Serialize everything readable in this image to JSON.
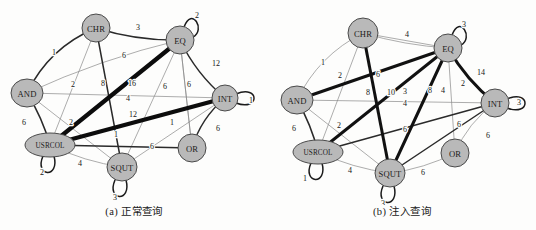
{
  "figure": {
    "title": "",
    "panels": [
      {
        "id": "a",
        "caption": "(a) 正常查询",
        "nodes": [
          {
            "id": "CHR",
            "label": "CHR",
            "x": 96,
            "y": 28,
            "rx": 14,
            "ry": 14
          },
          {
            "id": "EQ",
            "label": "EQ",
            "x": 180,
            "y": 40,
            "rx": 14,
            "ry": 14
          },
          {
            "id": "AND",
            "label": "AND",
            "x": 27,
            "y": 93,
            "rx": 16,
            "ry": 14
          },
          {
            "id": "INT",
            "label": "INT",
            "x": 225,
            "y": 98,
            "rx": 13,
            "ry": 13
          },
          {
            "id": "USRCOL",
            "label": "USRCOL",
            "x": 50,
            "y": 145,
            "rx": 25,
            "ry": 12
          },
          {
            "id": "SQUT",
            "label": "SQUT",
            "x": 122,
            "y": 167,
            "rx": 15,
            "ry": 14
          },
          {
            "id": "OR",
            "label": "OR",
            "x": 192,
            "y": 148,
            "rx": 14,
            "ry": 14
          }
        ],
        "edges": [
          {
            "from": "AND",
            "to": "CHR",
            "weight": 1,
            "width": "mid",
            "lx": 54,
            "ly": 52,
            "curve": -18
          },
          {
            "from": "CHR",
            "to": "EQ",
            "weight": 3,
            "width": "mid",
            "lx": 138,
            "ly": 27,
            "curve": 7
          },
          {
            "from": "AND",
            "to": "EQ",
            "weight": 6,
            "width": "thin",
            "lx": 124,
            "ly": 55,
            "curve": -8
          },
          {
            "from": "CHR",
            "to": "USRCOL",
            "weight": 2,
            "width": "thin",
            "lx": 73,
            "ly": 84,
            "curve": 0
          },
          {
            "from": "CHR",
            "to": "SQUT",
            "weight": 8,
            "width": "mid",
            "lx": 103,
            "ly": 83,
            "curve": 0
          },
          {
            "from": "USRCOL",
            "to": "EQ",
            "weight": 16,
            "width": "xthick",
            "lx": 132,
            "ly": 83,
            "curve": 0
          },
          {
            "from": "EQ",
            "to": "INT",
            "weight": 12,
            "width": "mid",
            "lx": 216,
            "ly": 63,
            "curve": 8
          },
          {
            "from": "AND",
            "to": "INT",
            "weight": 4,
            "width": "thin",
            "lx": 128,
            "ly": 98,
            "curve": 0
          },
          {
            "from": "USRCOL",
            "to": "INT",
            "weight": 12,
            "width": "xthick",
            "lx": 133,
            "ly": 114,
            "curve": 0
          },
          {
            "from": "EQ",
            "to": "SQUT",
            "weight": 6,
            "width": "thin",
            "lx": 165,
            "ly": 86,
            "curve": 0
          },
          {
            "from": "EQ",
            "to": "OR",
            "weight": 6,
            "width": "thin",
            "lx": 189,
            "ly": 84,
            "curve": 0
          },
          {
            "from": "AND",
            "to": "USRCOL",
            "weight": 6,
            "width": "mid",
            "lx": 24,
            "ly": 122,
            "curve": -4
          },
          {
            "from": "AND",
            "to": "SQUT",
            "weight": 2,
            "width": "thin",
            "lx": 71,
            "ly": 122,
            "curve": 0
          },
          {
            "from": "USRCOL",
            "to": "OR",
            "weight": 6,
            "width": "mid",
            "lx": 152,
            "ly": 146,
            "curve": 0
          },
          {
            "from": "SQUT",
            "to": "INT",
            "weight": 1,
            "width": "thin",
            "lx": 116,
            "ly": 134,
            "curve": 0
          },
          {
            "from": "OR",
            "to": "EQ",
            "weight": 1,
            "width": "thin",
            "lx": 172,
            "ly": 122,
            "curve": 0
          },
          {
            "from": "USRCOL",
            "to": "SQUT",
            "weight": 4,
            "width": "thin",
            "lx": 80,
            "ly": 163,
            "curve": 6
          },
          {
            "from": "INT",
            "to": "OR",
            "weight": 6,
            "width": "mid",
            "lx": 218,
            "ly": 128,
            "curve": 9
          }
        ],
        "self_loops": [
          {
            "node": "EQ",
            "weight": 2,
            "lx": 197,
            "ly": 15,
            "dir": "up-right"
          },
          {
            "node": "INT",
            "weight": 1,
            "lx": 251,
            "ly": 100,
            "dir": "right"
          },
          {
            "node": "USRCOL",
            "weight": 2,
            "lx": 42,
            "ly": 172,
            "dir": "down"
          },
          {
            "node": "SQUT",
            "weight": 3,
            "lx": 115,
            "ly": 197,
            "dir": "down"
          }
        ]
      },
      {
        "id": "b",
        "caption": "(b) 注入查询",
        "nodes": [
          {
            "id": "CHR",
            "label": "CHR",
            "x": 95,
            "y": 33,
            "rx": 15,
            "ry": 15
          },
          {
            "id": "EQ",
            "label": "EQ",
            "x": 180,
            "y": 48,
            "rx": 14,
            "ry": 14
          },
          {
            "id": "AND",
            "label": "AND",
            "x": 29,
            "y": 100,
            "rx": 16,
            "ry": 14
          },
          {
            "id": "INT",
            "label": "INT",
            "x": 227,
            "y": 103,
            "rx": 14,
            "ry": 14
          },
          {
            "id": "USRCOL",
            "label": "USRCOL",
            "x": 50,
            "y": 152,
            "rx": 25,
            "ry": 12
          },
          {
            "id": "SQUT",
            "label": "SQUT",
            "x": 122,
            "y": 173,
            "rx": 15,
            "ry": 14
          },
          {
            "id": "OR",
            "label": "OR",
            "x": 187,
            "y": 153,
            "rx": 14,
            "ry": 14
          }
        ],
        "edges": [
          {
            "from": "AND",
            "to": "CHR",
            "weight": 1,
            "width": "thin",
            "lx": 55,
            "ly": 62,
            "curve": -16
          },
          {
            "from": "CHR",
            "to": "EQ",
            "weight": 4,
            "width": "thin",
            "lx": 139,
            "ly": 34,
            "curve": 5
          },
          {
            "from": "CHR",
            "to": "USRCOL",
            "weight": 2,
            "width": "thin",
            "lx": 72,
            "ly": 75,
            "curve": 0
          },
          {
            "from": "CHR",
            "to": "SQUT",
            "weight": 8,
            "width": "thick",
            "lx": 100,
            "ly": 92,
            "curve": 0
          },
          {
            "from": "AND",
            "to": "EQ",
            "weight": 6,
            "width": "thick",
            "lx": 110,
            "ly": 74,
            "curve": 0
          },
          {
            "from": "EQ",
            "to": "USRCOL",
            "weight": 10,
            "width": "thick",
            "lx": 123,
            "ly": 92,
            "curve": 0
          },
          {
            "from": "EQ",
            "to": "INT",
            "weight": 14,
            "width": "thick",
            "lx": 213,
            "ly": 72,
            "curve": 7
          },
          {
            "from": "EQ",
            "to": "AND",
            "weight": 3,
            "width": "thin",
            "lx": 137,
            "ly": 91,
            "curve": 0
          },
          {
            "from": "EQ",
            "to": "SQUT",
            "weight": 8,
            "width": "thick",
            "lx": 162,
            "ly": 90,
            "curve": 0
          },
          {
            "from": "EQ",
            "to": "OR",
            "weight": 4,
            "width": "thin",
            "lx": 175,
            "ly": 90,
            "curve": 0
          },
          {
            "from": "EQ",
            "to": "CHR",
            "weight": 2,
            "width": "thin",
            "lx": 195,
            "ly": 83,
            "curve": 0
          },
          {
            "from": "AND",
            "to": "INT",
            "weight": 4,
            "width": "thin",
            "lx": 137,
            "ly": 103,
            "curve": 0
          },
          {
            "from": "AND",
            "to": "SQUT",
            "weight": 2,
            "width": "thin",
            "lx": 71,
            "ly": 125,
            "curve": 0
          },
          {
            "from": "AND",
            "to": "USRCOL",
            "weight": 6,
            "width": "mid",
            "lx": 26,
            "ly": 128,
            "curve": -4
          },
          {
            "from": "USRCOL",
            "to": "INT",
            "weight": 6,
            "width": "mid",
            "lx": 137,
            "ly": 129,
            "curve": 0
          },
          {
            "from": "SQUT",
            "to": "INT",
            "weight": 6,
            "width": "mid",
            "lx": 191,
            "ly": 124,
            "curve": 0
          },
          {
            "from": "USRCOL",
            "to": "SQUT",
            "weight": 4,
            "width": "thin",
            "lx": 82,
            "ly": 170,
            "curve": 6
          },
          {
            "from": "SQUT",
            "to": "OR",
            "weight": 6,
            "width": "thin",
            "lx": 155,
            "ly": 172,
            "curve": 6
          },
          {
            "from": "INT",
            "to": "OR",
            "weight": 6,
            "width": "thin",
            "lx": 220,
            "ly": 135,
            "curve": 9
          }
        ],
        "self_loops": [
          {
            "node": "EQ",
            "weight": 3,
            "lx": 196,
            "ly": 24,
            "dir": "up-right"
          },
          {
            "node": "INT",
            "weight": 3,
            "lx": 251,
            "ly": 102,
            "dir": "right"
          },
          {
            "node": "USRCOL",
            "weight": 1,
            "lx": 37,
            "ly": 178,
            "dir": "down"
          },
          {
            "node": "SQUT",
            "weight": 3,
            "lx": 115,
            "ly": 203,
            "dir": "down"
          }
        ]
      }
    ]
  },
  "colors": {
    "node_fill": "#b9b9b9",
    "node_stroke": "#4a4a4a",
    "edge_thin": "#8a8a8a",
    "edge_thick": "#111111",
    "background": "#fdfdfc",
    "text": "#111111"
  }
}
